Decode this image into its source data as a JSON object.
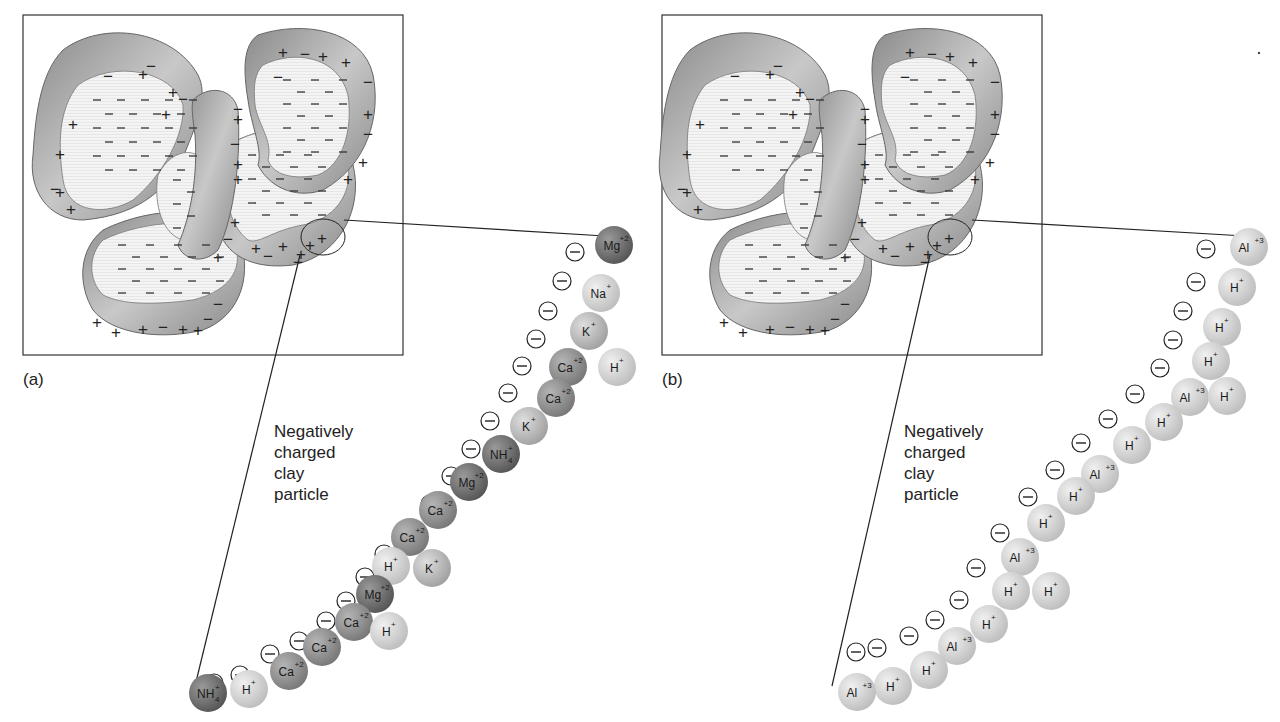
{
  "figure": {
    "panels": [
      {
        "id": "a",
        "label": "(a)",
        "caption": "Negatively\ncharged\nclay\nparticle",
        "ions": [
          {
            "symbol": "Mg",
            "charge": "+2",
            "tone": "dark"
          },
          {
            "symbol": "Na",
            "charge": "+",
            "tone": "light"
          },
          {
            "symbol": "K",
            "charge": "+",
            "tone": "mid-light"
          },
          {
            "symbol": "Ca",
            "charge": "+2",
            "tone": "mid"
          },
          {
            "symbol": "H",
            "charge": "+",
            "tone": "light"
          },
          {
            "symbol": "Ca",
            "charge": "+2",
            "tone": "mid"
          },
          {
            "symbol": "K",
            "charge": "+",
            "tone": "mid-light"
          },
          {
            "symbol": "NH4",
            "charge": "+",
            "tone": "dark"
          },
          {
            "symbol": "Mg",
            "charge": "+2",
            "tone": "dark"
          },
          {
            "symbol": "Ca",
            "charge": "+2",
            "tone": "mid"
          },
          {
            "symbol": "Ca",
            "charge": "+2",
            "tone": "mid"
          },
          {
            "symbol": "H",
            "charge": "+",
            "tone": "light"
          },
          {
            "symbol": "K",
            "charge": "+",
            "tone": "mid-light"
          },
          {
            "symbol": "Mg",
            "charge": "+2",
            "tone": "dark"
          },
          {
            "symbol": "Ca",
            "charge": "+2",
            "tone": "mid"
          },
          {
            "symbol": "H",
            "charge": "+",
            "tone": "light"
          },
          {
            "symbol": "Ca",
            "charge": "+2",
            "tone": "mid"
          },
          {
            "symbol": "Ca",
            "charge": "+2",
            "tone": "mid"
          },
          {
            "symbol": "H",
            "charge": "+",
            "tone": "light"
          },
          {
            "symbol": "NH4",
            "charge": "+",
            "tone": "dark"
          }
        ]
      },
      {
        "id": "b",
        "label": "(b)",
        "caption": "Negatively\ncharged\nclay\nparticle",
        "ions": [
          {
            "symbol": "Al",
            "charge": "+3",
            "tone": "light"
          },
          {
            "symbol": "H",
            "charge": "+",
            "tone": "light"
          },
          {
            "symbol": "H",
            "charge": "+",
            "tone": "light"
          },
          {
            "symbol": "H",
            "charge": "+",
            "tone": "light"
          },
          {
            "symbol": "Al",
            "charge": "+3",
            "tone": "light"
          },
          {
            "symbol": "H",
            "charge": "+",
            "tone": "light"
          },
          {
            "symbol": "H",
            "charge": "+",
            "tone": "light"
          },
          {
            "symbol": "H",
            "charge": "+",
            "tone": "light"
          },
          {
            "symbol": "Al",
            "charge": "+3",
            "tone": "light"
          },
          {
            "symbol": "H",
            "charge": "+",
            "tone": "light"
          },
          {
            "symbol": "H",
            "charge": "+",
            "tone": "light"
          },
          {
            "symbol": "Al",
            "charge": "+3",
            "tone": "light"
          },
          {
            "symbol": "H",
            "charge": "+",
            "tone": "light"
          },
          {
            "symbol": "H",
            "charge": "+",
            "tone": "light"
          },
          {
            "symbol": "H",
            "charge": "+",
            "tone": "light"
          },
          {
            "symbol": "Al",
            "charge": "+3",
            "tone": "light"
          },
          {
            "symbol": "H",
            "charge": "+",
            "tone": "light"
          },
          {
            "symbol": "H",
            "charge": "+",
            "tone": "light"
          },
          {
            "symbol": "Al",
            "charge": "+3",
            "tone": "light"
          }
        ]
      }
    ],
    "charge_symbols": {
      "negative": "−",
      "positive": "+"
    },
    "colors": {
      "dark": "#6e6e6e",
      "mid": "#8f8f8f",
      "mid-light": "#b8b8b8",
      "light": "#d8d8d8",
      "clay_shell": "#9a9a9a",
      "clay_core": "#f2f2f2",
      "line": "#222222"
    }
  }
}
